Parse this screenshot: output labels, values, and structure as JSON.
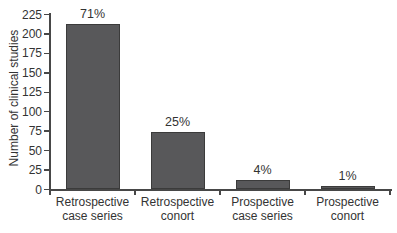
{
  "chart_data": {
    "type": "bar",
    "title": "",
    "xlabel": "",
    "ylabel": "Number of clinical studies",
    "ylim": [
      0,
      225
    ],
    "ytick_step": 25,
    "yticks": [
      0,
      25,
      50,
      75,
      100,
      125,
      150,
      175,
      200,
      225
    ],
    "grid": false,
    "legend": "none",
    "categories": [
      "Retrospective case series",
      "Retrospective conort",
      "Prospective case series",
      "Prospective conort"
    ],
    "category_lines": [
      [
        "Retrospective",
        "case series"
      ],
      [
        "Retrospective",
        "conort"
      ],
      [
        "Prospective",
        "case series"
      ],
      [
        "Prospective",
        "conort"
      ]
    ],
    "values": [
      213,
      74,
      12,
      4
    ],
    "bar_labels": [
      "71%",
      "25%",
      "4%",
      "1%"
    ],
    "bar_color": "#58585a",
    "bar_border_color": "#3b3b3b",
    "axis_color": "#474747",
    "text_color": "#333333",
    "background_color": "#ffffff"
  }
}
